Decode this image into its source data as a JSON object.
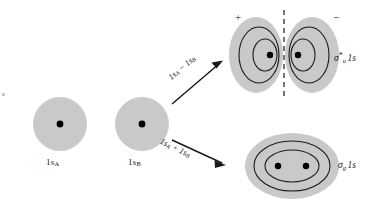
{
  "figure": {
    "background_color": "#ffffff",
    "cloud_color": "#c9c9c9",
    "contour_color": "#1a1a1a",
    "nucleus_color": "#000000",
    "width": 377,
    "height": 211
  },
  "atomic_orbitals": [
    {
      "id": "ao-a",
      "label": "1s",
      "subscript": "A",
      "shape": "circle",
      "cx": 60,
      "cy": 124,
      "r": 27,
      "nucleus_count": 1
    },
    {
      "id": "ao-b",
      "label": "1s",
      "subscript": "B",
      "shape": "circle",
      "cx": 142,
      "cy": 124,
      "r": 27,
      "nucleus_count": 1
    }
  ],
  "combinations": [
    {
      "id": "antibonding-arrow",
      "operator": "minus",
      "label_left": "1s",
      "label_left_sub": "A",
      "operator_symbol": "−",
      "label_right": "1s",
      "label_right_sub": "B",
      "full_text": "1sA − 1sB",
      "direction": "up-right"
    },
    {
      "id": "bonding-arrow",
      "operator": "plus",
      "label_left": "1s",
      "label_left_sub": "A",
      "operator_symbol": "+",
      "label_right": "1s",
      "label_right_sub": "B",
      "full_text": "1sA + 1sB",
      "direction": "down-right"
    }
  ],
  "molecular_orbitals": [
    {
      "id": "mo-antibonding",
      "type": "antibonding",
      "symbol": "σ",
      "subscript": "u",
      "superscript": "*",
      "orbital": "1s",
      "full_label": "σ*u 1s",
      "has_nodal_plane": true,
      "nodal_plane_style": "dashed-vertical",
      "lobe_signs": [
        "+",
        "−"
      ],
      "nucleus_count": 2,
      "contours_per_lobe": 2
    },
    {
      "id": "mo-bonding",
      "type": "bonding",
      "symbol": "σ",
      "subscript": "g",
      "superscript": "",
      "orbital": "1s",
      "full_label": "σg 1s",
      "has_nodal_plane": false,
      "lobe_signs": [],
      "nucleus_count": 2,
      "contours": 2
    }
  ]
}
